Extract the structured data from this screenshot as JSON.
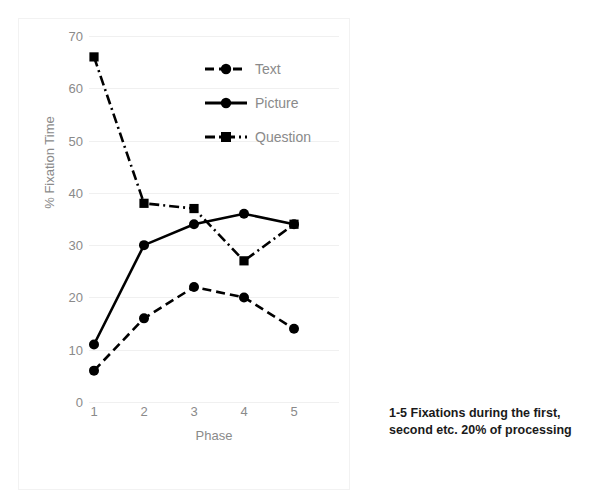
{
  "chart_data": {
    "type": "line",
    "title": "",
    "xlabel": "Phase",
    "ylabel": "% Fixation Time",
    "categories": [
      "1",
      "2",
      "3",
      "4",
      "5"
    ],
    "ylim": [
      0,
      70
    ],
    "yticks": [
      0,
      10,
      20,
      30,
      40,
      50,
      60,
      70
    ],
    "ytick_labels": [
      "0",
      "10",
      "20",
      "30",
      "40",
      "50",
      "60",
      "70"
    ],
    "grid": true,
    "grid_axis": "y",
    "legend_position": "upper-center-right",
    "series": [
      {
        "name": "Text",
        "values": [
          6,
          16,
          22,
          20,
          14
        ],
        "line_style": "dashed",
        "marker": "circle",
        "color": "#000000"
      },
      {
        "name": "Picture",
        "values": [
          11,
          30,
          34,
          36,
          34
        ],
        "line_style": "solid",
        "marker": "circle",
        "color": "#000000"
      },
      {
        "name": "Question",
        "values": [
          66,
          38,
          37,
          27,
          34
        ],
        "line_style": "dash-dot",
        "marker": "square",
        "color": "#000000"
      }
    ],
    "annotations": [
      "1-5   Fixations during the first, second etc. 20% of processing"
    ]
  },
  "caption": {
    "line1": "1-5   Fixations during the first,",
    "line2": "second etc. 20% of processing"
  },
  "colors": {
    "series": "#000000",
    "axis_text": "#8a8a8a",
    "gridline": "#f0f0f0",
    "caption_text": "#1a1a1a",
    "background": "#ffffff"
  }
}
